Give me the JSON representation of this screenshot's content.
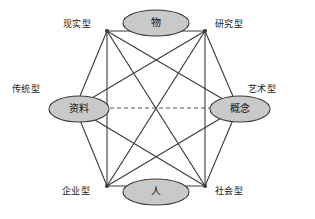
{
  "diagram": {
    "title_visible": false,
    "canvas": {
      "width": 315,
      "height": 219
    },
    "style": {
      "line_color": "#3a3a3a",
      "dashed_color": "#555555",
      "ellipse_fill": "#c9c9c9",
      "ellipse_stroke": "#3a3a3a",
      "text_color": "#1a1a1a",
      "background": "#ffffff"
    },
    "vertices": [
      {
        "id": "realistic",
        "label": "现实型",
        "x": 107,
        "y": 31,
        "label_x": 63,
        "label_y": 20
      },
      {
        "id": "investigative",
        "label": "研究型",
        "x": 205,
        "y": 31,
        "label_x": 215,
        "label_y": 20
      },
      {
        "id": "artistic",
        "label": "艺术型",
        "x": 238,
        "y": 108,
        "label_x": 248,
        "label_y": 85
      },
      {
        "id": "social",
        "label": "社会型",
        "x": 205,
        "y": 186,
        "label_x": 215,
        "label_y": 187
      },
      {
        "id": "enterprising",
        "label": "企业型",
        "x": 107,
        "y": 186,
        "label_x": 62,
        "label_y": 187
      },
      {
        "id": "conventional",
        "label": "传统型",
        "x": 75,
        "y": 108,
        "label_x": 12,
        "label_y": 85
      }
    ],
    "nodes": [
      {
        "id": "things",
        "label": "物",
        "cx": 156,
        "cy": 23,
        "rx": 33,
        "ry": 13
      },
      {
        "id": "data",
        "label": "资料",
        "cx": 79,
        "cy": 109,
        "rx": 30,
        "ry": 13
      },
      {
        "id": "concept",
        "label": "概念",
        "cx": 240,
        "cy": 109,
        "rx": 30,
        "ry": 13
      },
      {
        "id": "people",
        "label": "人",
        "cx": 156,
        "cy": 192,
        "rx": 33,
        "ry": 13
      }
    ],
    "solid_edges": [
      [
        "realistic",
        "investigative"
      ],
      [
        "investigative",
        "artistic"
      ],
      [
        "artistic",
        "social"
      ],
      [
        "social",
        "enterprising"
      ],
      [
        "enterprising",
        "conventional"
      ],
      [
        "conventional",
        "realistic"
      ],
      [
        "realistic",
        "enterprising"
      ],
      [
        "investigative",
        "social"
      ],
      [
        "realistic",
        "artistic"
      ],
      [
        "realistic",
        "social"
      ],
      [
        "investigative",
        "conventional"
      ],
      [
        "investigative",
        "enterprising"
      ],
      [
        "artistic",
        "enterprising"
      ],
      [
        "social",
        "conventional"
      ]
    ],
    "dashed_edges": [
      [
        "conventional",
        "artistic"
      ],
      [
        "realistic",
        "social"
      ],
      [
        "investigative",
        "enterprising"
      ]
    ]
  }
}
